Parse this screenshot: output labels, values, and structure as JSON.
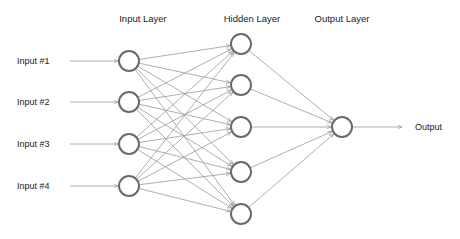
{
  "layers": {
    "input": {
      "label": "Input Layer",
      "x": 129,
      "label_x": 143,
      "nodes_y": [
        61,
        102,
        144,
        186
      ]
    },
    "hidden": {
      "label": "Hidden Layer",
      "x": 241,
      "label_x": 252,
      "nodes_y": [
        44,
        85,
        127,
        172,
        214
      ]
    },
    "output": {
      "label": "Output Layer",
      "x": 342,
      "label_x": 342,
      "nodes_y": [
        127
      ]
    }
  },
  "header_y": 22,
  "node_radius": 10,
  "inputs": [
    {
      "label": "Input #1",
      "y": 61
    },
    {
      "label": "Input #2",
      "y": 102
    },
    {
      "label": "Input #3",
      "y": 144
    },
    {
      "label": "Input #4",
      "y": 186
    }
  ],
  "input_arrow": {
    "x1": 70,
    "x2": 118
  },
  "output": {
    "label": "Output",
    "arrow_x2": 402,
    "label_x": 415
  },
  "colors": {
    "node_stroke": "#6a6a6a",
    "edge": "#9a9a9a",
    "text": "#222222"
  }
}
